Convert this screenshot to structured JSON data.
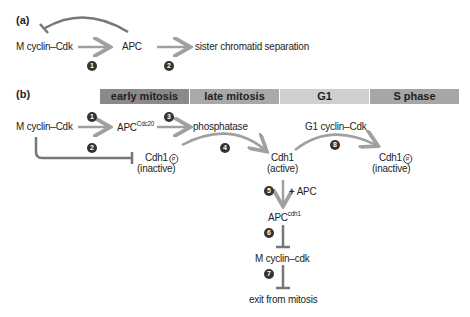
{
  "panel_a": {
    "label": "(a)",
    "nodes": {
      "m_cyclin": "M cyclin–Cdk",
      "apc": "APC",
      "separation": "sister chromatid separation"
    },
    "steps": [
      "1",
      "2"
    ]
  },
  "panel_b": {
    "label": "(b)",
    "phases": [
      {
        "label": "early mitosis",
        "color": "#8a8a8a"
      },
      {
        "label": "late mitosis",
        "color": "#a9a9a9"
      },
      {
        "label": "G1",
        "color": "#cfcfcf"
      },
      {
        "label": "S phase",
        "color": "#a6a6a6"
      }
    ],
    "nodes": {
      "m_cyclin": "M cyclin–Cdk",
      "apc": "APC",
      "apc_sup": "Cdc20",
      "phosphatase": "phosphatase",
      "g1_cyclin": "G1 cyclin–Cdk",
      "cdh1_p1": "Cdh1",
      "inactive1": "(inactive)",
      "cdh1_active": "Cdh1",
      "active": "(active)",
      "cdh1_p2": "Cdh1",
      "inactive2": "(inactive)",
      "plus_apc": "+ APC",
      "apc2": "APC",
      "apc2_sup": "cdh1",
      "m_cyclin2": "M cyclin–cdk",
      "exit": "exit from mitosis",
      "p_symbol": "P"
    },
    "steps": [
      "1",
      "2",
      "3",
      "4",
      "5",
      "6",
      "7",
      "8"
    ]
  },
  "colors": {
    "arrow": "#a0a0a0",
    "inhibit": "#777777"
  }
}
